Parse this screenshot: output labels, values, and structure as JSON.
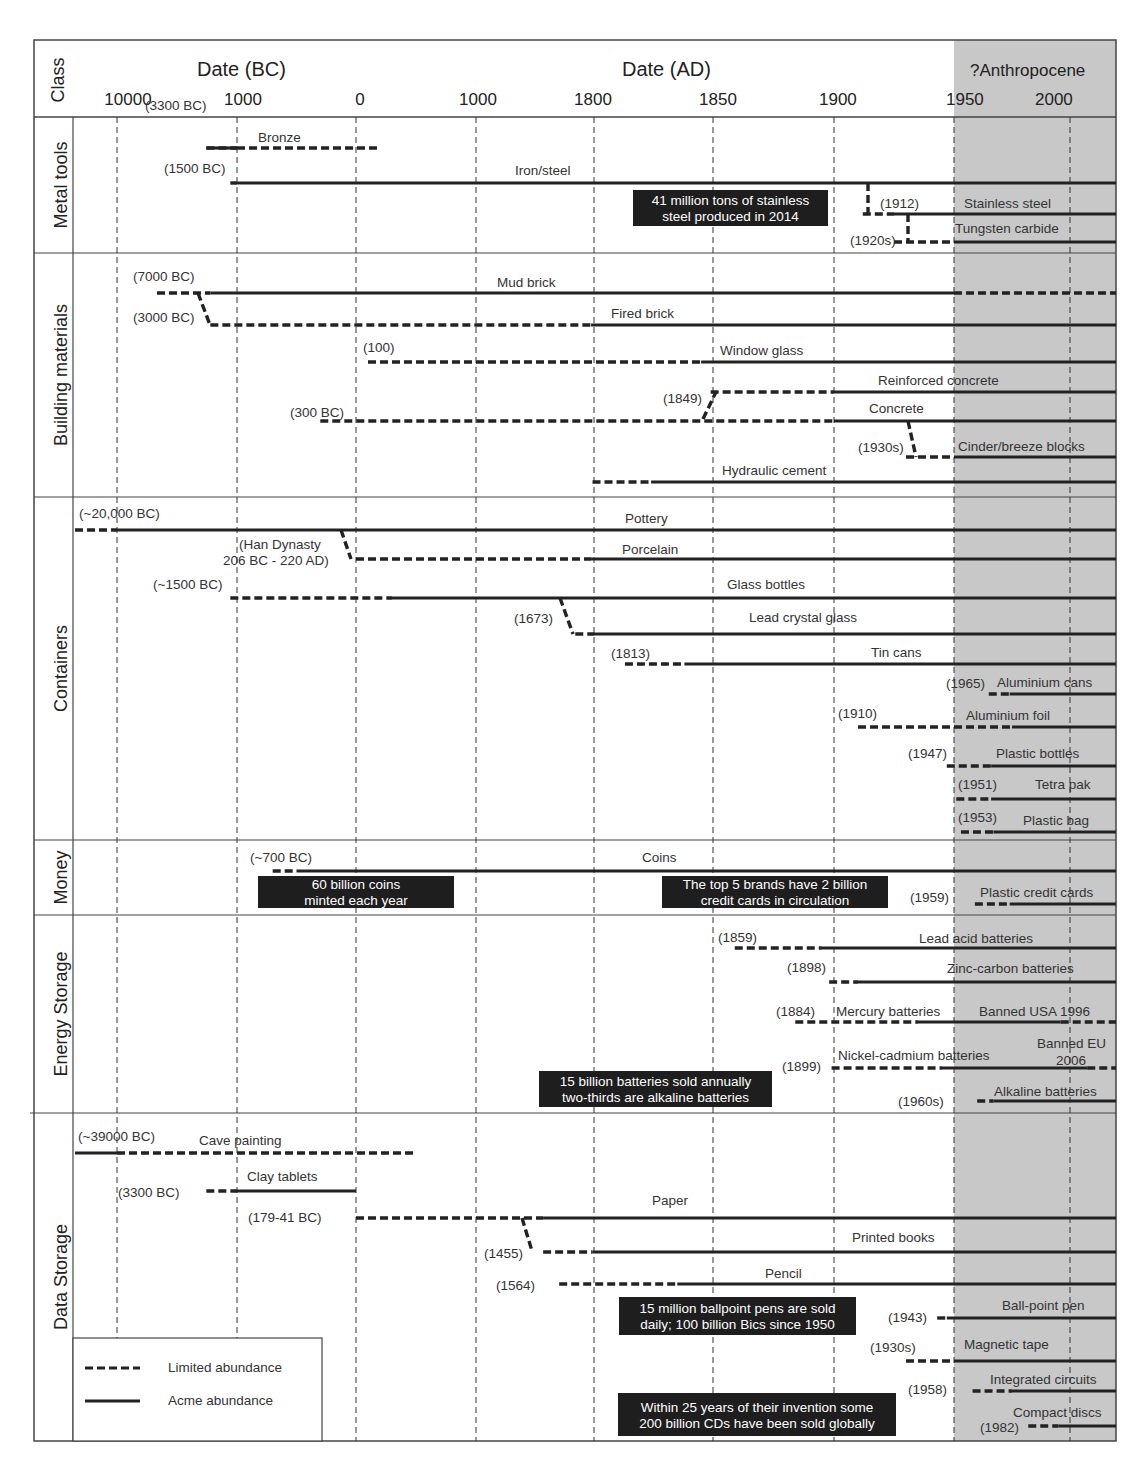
{
  "chart_data": {
    "type": "timeline",
    "title": "",
    "header": {
      "class_label": "Class",
      "bc_label": "Date (BC)",
      "ad_label": "Date (AD)",
      "anthropocene_label": "?Anthropocene"
    },
    "x_ticks": [
      {
        "label": "10000",
        "year": -10000
      },
      {
        "label": "1000",
        "year": -1000
      },
      {
        "label": "0",
        "year": 0
      },
      {
        "label": "1000",
        "year": 1000
      },
      {
        "label": "1800",
        "year": 1800
      },
      {
        "label": "1850",
        "year": 1850
      },
      {
        "label": "1900",
        "year": 1900
      },
      {
        "label": "1950",
        "year": 1950
      },
      {
        "label": "2000",
        "year": 2000
      }
    ],
    "x_range": [
      -20000,
      2016
    ],
    "shaded_region": {
      "from": 1950,
      "to": 2016,
      "label": "?Anthropocene",
      "color": "#c8c8c8"
    },
    "legend": {
      "position": "bottom-left",
      "items": [
        {
          "label": "Limited abundance",
          "style": "dashed"
        },
        {
          "label": "Acme abundance",
          "style": "solid"
        }
      ]
    },
    "classes": [
      {
        "name": "Metal tools",
        "items": [
          {
            "name": "Bronze",
            "date_label": "(3300 BC)",
            "start": -3300,
            "segments": [
              {
                "from": -3300,
                "to": -1000,
                "style": "dashed"
              },
              {
                "from": -3300,
                "to": -1000,
                "style": "solid"
              },
              {
                "from": -1000,
                "to": 200,
                "style": "dashed"
              }
            ]
          },
          {
            "name": "Iron/steel",
            "date_label": "(1500 BC)",
            "start": -1500,
            "segments": [
              {
                "from": -1500,
                "to": -1000,
                "style": "dashed"
              },
              {
                "from": -1000,
                "to": 2016,
                "style": "solid"
              }
            ]
          },
          {
            "name": "Stainless steel",
            "date_label": "(1912)",
            "start": 1912,
            "segments": [
              {
                "from": 1912,
                "to": 1925,
                "style": "dashed"
              },
              {
                "from": 1925,
                "to": 2016,
                "style": "solid"
              }
            ]
          },
          {
            "name": "Tungsten carbide",
            "date_label": "(1920s)",
            "start": 1925,
            "segments": [
              {
                "from": 1925,
                "to": 1950,
                "style": "dashed"
              },
              {
                "from": 1950,
                "to": 2016,
                "style": "solid"
              }
            ]
          }
        ],
        "notes": [
          {
            "text": "41 million tons of stainless steel produced in 2014"
          }
        ]
      },
      {
        "name": "Building materials",
        "items": [
          {
            "name": "Mud brick",
            "date_label": "(7000 BC)",
            "start": -7000,
            "segments": [
              {
                "from": -7000,
                "to": -3000,
                "style": "dashed"
              },
              {
                "from": -3000,
                "to": 1950,
                "style": "solid"
              },
              {
                "from": 1950,
                "to": 2016,
                "style": "dashed"
              }
            ]
          },
          {
            "name": "Fired brick",
            "date_label": "(3000 BC)",
            "start": -3000,
            "segments": [
              {
                "from": -3000,
                "to": 1780,
                "style": "dashed"
              },
              {
                "from": 1780,
                "to": 2016,
                "style": "solid"
              }
            ]
          },
          {
            "name": "Window glass",
            "date_label": "(100)",
            "start": 100,
            "segments": [
              {
                "from": 100,
                "to": 1845,
                "style": "dashed"
              },
              {
                "from": 1845,
                "to": 2016,
                "style": "solid"
              }
            ]
          },
          {
            "name": "Reinforced concrete",
            "date_label": "(1849)",
            "start": 1849,
            "segments": [
              {
                "from": 1849,
                "to": 1900,
                "style": "dashed"
              },
              {
                "from": 1900,
                "to": 2016,
                "style": "solid"
              }
            ]
          },
          {
            "name": "Concrete",
            "date_label": "(300 BC)",
            "start": -300,
            "segments": [
              {
                "from": -300,
                "to": 1900,
                "style": "dashed"
              },
              {
                "from": 1900,
                "to": 2016,
                "style": "solid"
              }
            ]
          },
          {
            "name": "Cinder/breeze blocks",
            "date_label": "(1930s)",
            "start": 1930,
            "segments": [
              {
                "from": 1930,
                "to": 1950,
                "style": "dashed"
              },
              {
                "from": 1950,
                "to": 2016,
                "style": "solid"
              }
            ]
          },
          {
            "name": "Hydraulic cement",
            "date_label": "",
            "start": 1790,
            "segments": [
              {
                "from": 1790,
                "to": 1824,
                "style": "dashed"
              },
              {
                "from": 1824,
                "to": 2016,
                "style": "solid"
              }
            ]
          }
        ]
      },
      {
        "name": "Containers",
        "items": [
          {
            "name": "Pottery",
            "date_label": "(~20,000 BC)",
            "start": -20000,
            "segments": [
              {
                "from": -20000,
                "to": -10000,
                "style": "dashed"
              },
              {
                "from": -10000,
                "to": 2016,
                "style": "solid"
              }
            ]
          },
          {
            "name": "Porcelain",
            "date_label": "(Han Dynasty 206 BC - 220 AD)",
            "start": -206,
            "segments": [
              {
                "from": 0,
                "to": 1780,
                "style": "dashed"
              },
              {
                "from": 1780,
                "to": 2016,
                "style": "solid"
              }
            ]
          },
          {
            "name": "Glass bottles",
            "date_label": "(~1500 BC)",
            "start": -1500,
            "segments": [
              {
                "from": -1500,
                "to": 300,
                "style": "dashed"
              },
              {
                "from": 300,
                "to": 2016,
                "style": "solid"
              }
            ]
          },
          {
            "name": "Lead crystal glass",
            "date_label": "(1673)",
            "start": 1673,
            "segments": [
              {
                "from": 1673,
                "to": 1800,
                "style": "dashed"
              },
              {
                "from": 1800,
                "to": 2016,
                "style": "solid"
              }
            ]
          },
          {
            "name": "Tin cans",
            "date_label": "(1813)",
            "start": 1813,
            "segments": [
              {
                "from": 1813,
                "to": 1838,
                "style": "dashed"
              },
              {
                "from": 1838,
                "to": 2016,
                "style": "solid"
              }
            ]
          },
          {
            "name": "Aluminium cans",
            "date_label": "(1965)",
            "start": 1965,
            "segments": [
              {
                "from": 1965,
                "to": 1974,
                "style": "dashed"
              },
              {
                "from": 1974,
                "to": 2016,
                "style": "solid"
              }
            ]
          },
          {
            "name": "Aluminium foil",
            "date_label": "(1910)",
            "start": 1910,
            "segments": [
              {
                "from": 1910,
                "to": 1975,
                "style": "dashed"
              },
              {
                "from": 1975,
                "to": 2016,
                "style": "solid"
              }
            ]
          },
          {
            "name": "Plastic bottles",
            "date_label": "(1947)",
            "start": 1947,
            "segments": [
              {
                "from": 1947,
                "to": 1966,
                "style": "dashed"
              },
              {
                "from": 1966,
                "to": 2016,
                "style": "solid"
              }
            ]
          },
          {
            "name": "Tetra pak",
            "date_label": "(1951)",
            "start": 1951,
            "segments": [
              {
                "from": 1951,
                "to": 1966,
                "style": "dashed"
              },
              {
                "from": 1966,
                "to": 2016,
                "style": "solid"
              }
            ]
          },
          {
            "name": "Plastic bag",
            "date_label": "(1953)",
            "start": 1953,
            "segments": [
              {
                "from": 1953,
                "to": 1967,
                "style": "dashed"
              },
              {
                "from": 1967,
                "to": 2016,
                "style": "solid"
              }
            ]
          }
        ]
      },
      {
        "name": "Money",
        "items": [
          {
            "name": "Coins",
            "date_label": "(~700 BC)",
            "start": -700,
            "segments": [
              {
                "from": -700,
                "to": -500,
                "style": "dashed"
              },
              {
                "from": -500,
                "to": 2016,
                "style": "solid"
              }
            ]
          },
          {
            "name": "Plastic credit cards",
            "date_label": "(1959)",
            "start": 1959,
            "segments": [
              {
                "from": 1959,
                "to": 1974,
                "style": "dashed"
              },
              {
                "from": 1974,
                "to": 2016,
                "style": "solid"
              }
            ]
          }
        ],
        "notes": [
          {
            "text": "60 billion coins minted each year"
          },
          {
            "text": "The top 5 brands have 2 billion credit cards in circulation"
          }
        ]
      },
      {
        "name": "Energy Storage",
        "items": [
          {
            "name": "Lead acid batteries",
            "date_label": "(1859)",
            "start": 1859,
            "segments": [
              {
                "from": 1859,
                "to": 1895,
                "style": "dashed"
              },
              {
                "from": 1895,
                "to": 2016,
                "style": "solid"
              }
            ]
          },
          {
            "name": "Zinc-carbon batteries",
            "date_label": "(1898)",
            "start": 1898,
            "segments": [
              {
                "from": 1898,
                "to": 1910,
                "style": "dashed"
              },
              {
                "from": 1910,
                "to": 2016,
                "style": "solid"
              }
            ]
          },
          {
            "name": "Mercury batteries",
            "date_label": "(1884)",
            "start": 1884,
            "annotation": "Banned USA 1996",
            "segments": [
              {
                "from": 1884,
                "to": 1935,
                "style": "dashed"
              },
              {
                "from": 1935,
                "to": 1996,
                "style": "solid"
              },
              {
                "from": 1996,
                "to": 2016,
                "style": "dashed"
              }
            ]
          },
          {
            "name": "Nickel-cadmium batteries",
            "date_label": "(1899)",
            "start": 1899,
            "annotation": "Banned EU 2006",
            "segments": [
              {
                "from": 1899,
                "to": 1945,
                "style": "dashed"
              },
              {
                "from": 1945,
                "to": 2006,
                "style": "solid"
              },
              {
                "from": 2006,
                "to": 2016,
                "style": "dashed"
              }
            ]
          },
          {
            "name": "Alkaline batteries",
            "date_label": "(1960s)",
            "start": 1960,
            "segments": [
              {
                "from": 1960,
                "to": 1967,
                "style": "dashed"
              },
              {
                "from": 1967,
                "to": 2016,
                "style": "solid"
              }
            ]
          }
        ],
        "notes": [
          {
            "text": "15 billion batteries sold annually two-thirds are alkaline batteries"
          }
        ]
      },
      {
        "name": "Data Storage",
        "items": [
          {
            "name": "Cave painting",
            "date_label": "(~39000 BC)",
            "start": -39000,
            "segments": [
              {
                "from": -20000,
                "to": -10000,
                "style": "solid"
              },
              {
                "from": -10000,
                "to": 500,
                "style": "dashed"
              }
            ]
          },
          {
            "name": "Clay tablets",
            "date_label": "(3300 BC)",
            "start": -3300,
            "segments": [
              {
                "from": -3300,
                "to": -1000,
                "style": "dashed"
              },
              {
                "from": -1000,
                "to": 0,
                "style": "solid"
              }
            ]
          },
          {
            "name": "Paper",
            "date_label": "(179-41 BC)",
            "start": -179,
            "segments": [
              {
                "from": 0,
                "to": 1455,
                "style": "dashed"
              },
              {
                "from": 1455,
                "to": 2016,
                "style": "solid"
              }
            ]
          },
          {
            "name": "Printed books",
            "date_label": "(1455)",
            "start": 1455,
            "segments": [
              {
                "from": 1455,
                "to": 1790,
                "style": "dashed"
              },
              {
                "from": 1790,
                "to": 2016,
                "style": "solid"
              }
            ]
          },
          {
            "name": "Pencil",
            "date_label": "(1564)",
            "start": 1564,
            "segments": [
              {
                "from": 1564,
                "to": 1835,
                "style": "dashed"
              },
              {
                "from": 1835,
                "to": 2016,
                "style": "solid"
              }
            ]
          },
          {
            "name": "Ball-point pen",
            "date_label": "(1943)",
            "start": 1943,
            "segments": [
              {
                "from": 1943,
                "to": 1947,
                "style": "dashed"
              },
              {
                "from": 1947,
                "to": 2016,
                "style": "solid"
              }
            ]
          },
          {
            "name": "Magnetic tape",
            "date_label": "(1930s)",
            "start": 1930,
            "segments": [
              {
                "from": 1930,
                "to": 1950,
                "style": "dashed"
              },
              {
                "from": 1950,
                "to": 2016,
                "style": "solid"
              }
            ]
          },
          {
            "name": "Integrated circuits",
            "date_label": "(1958)",
            "start": 1958,
            "segments": [
              {
                "from": 1958,
                "to": 1975,
                "style": "dashed"
              },
              {
                "from": 1975,
                "to": 2016,
                "style": "solid"
              }
            ]
          },
          {
            "name": "Compact discs",
            "date_label": "(1982)",
            "start": 1982,
            "segments": [
              {
                "from": 1982,
                "to": 1995,
                "style": "dashed"
              },
              {
                "from": 1995,
                "to": 2016,
                "style": "solid"
              }
            ]
          }
        ],
        "notes": [
          {
            "text": "15 million ballpoint pens are sold daily; 100 billion Bics since 1950"
          },
          {
            "text": "Within 25 years of their invention some 200 billion CDs have been sold globally"
          }
        ]
      }
    ]
  }
}
